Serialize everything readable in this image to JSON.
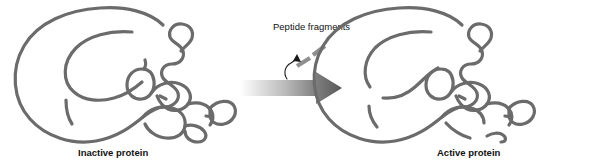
{
  "figure": {
    "type": "diagram",
    "background_color": "#ffffff",
    "chain_color": "#6b6b6b",
    "fragment_color": "#8f8f8f",
    "text_color": "#111111",
    "arrow_gradient_from": "#f2f2f2",
    "arrow_gradient_to": "#585858"
  },
  "labels": {
    "left_caption": "Inactive protein",
    "right_caption": "Active protein",
    "fragments_label": "Peptide fragments"
  },
  "icons": {
    "transition_arrow": "right-arrow-icon",
    "cleavage_pointer": "curved-up-arrow-icon",
    "fragment_dash": "peptide-fragment-icon"
  },
  "panels": [
    {
      "id": "inactive",
      "caption": "Inactive protein",
      "state": "uncleaved",
      "breaks": 0
    },
    {
      "id": "active",
      "caption": "Active protein",
      "state": "cleaved",
      "breaks": 4
    }
  ],
  "fragments": {
    "count": 2,
    "label": "Peptide fragments"
  }
}
